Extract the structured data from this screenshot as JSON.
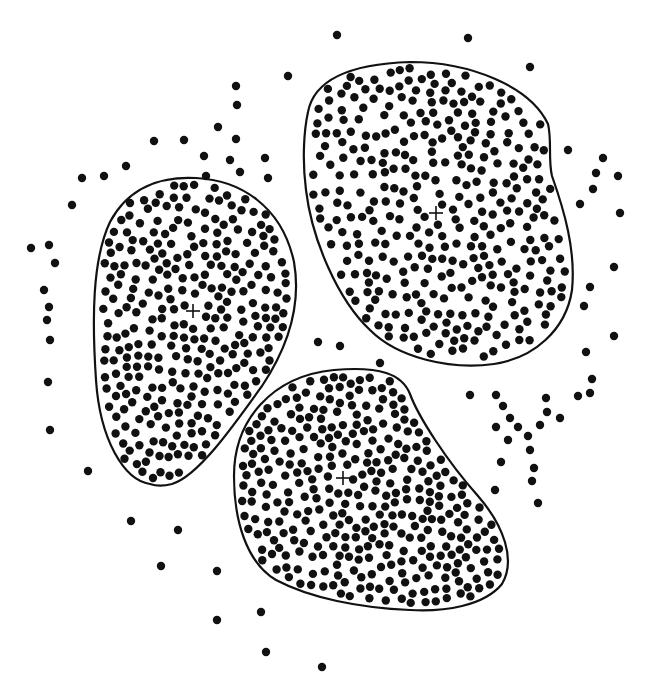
{
  "diagram": {
    "type": "cluster-scatter",
    "width": 662,
    "height": 685,
    "colors": {
      "background": "#ffffff",
      "ink": "#111111"
    },
    "point_radius": 4.2,
    "clusters": [
      {
        "name": "cluster-left",
        "centroid": [
          193,
          311
        ],
        "outline": "M150,484 C124,480 100,440 96,380 C92,320 92,260 110,222 C128,188 160,176 196,178 C240,180 282,206 294,262 C302,308 286,350 262,386 C232,428 198,476 172,484 C164,486 156,486 150,484 Z",
        "point_count": 290,
        "seed": 11
      },
      {
        "name": "cluster-top-right",
        "centroid": [
          436,
          213
        ],
        "outline": "M308,112 C314,80 348,64 410,62 C470,62 530,86 548,124 C552,140 548,160 552,176 C564,210 576,250 572,290 C566,330 534,358 494,364 C450,370 398,358 370,330 C338,300 312,240 306,190 C302,160 304,130 308,112 Z",
        "point_count": 340,
        "seed": 23
      },
      {
        "name": "cluster-bottom",
        "centroid": [
          343,
          478
        ],
        "outline": "M234,476 C234,420 272,376 334,370 C380,366 402,374 410,394 C418,416 446,460 478,496 C504,526 516,560 502,584 C484,606 444,612 410,610 C360,608 310,598 276,580 C246,562 234,520 234,476 Z",
        "point_count": 330,
        "seed": 37
      }
    ],
    "outliers": [
      [
        337,
        35
      ],
      [
        468,
        38
      ],
      [
        530,
        67
      ],
      [
        288,
        76
      ],
      [
        236,
        86
      ],
      [
        237,
        105
      ],
      [
        218,
        127
      ],
      [
        236,
        139
      ],
      [
        154,
        141
      ],
      [
        184,
        140
      ],
      [
        230,
        160
      ],
      [
        204,
        156
      ],
      [
        240,
        172
      ],
      [
        265,
        158
      ],
      [
        268,
        178
      ],
      [
        206,
        176
      ],
      [
        126,
        166
      ],
      [
        104,
        176
      ],
      [
        82,
        178
      ],
      [
        72,
        205
      ],
      [
        31,
        248
      ],
      [
        49,
        245
      ],
      [
        55,
        263
      ],
      [
        44,
        290
      ],
      [
        49,
        307
      ],
      [
        47,
        320
      ],
      [
        50,
        340
      ],
      [
        48,
        382
      ],
      [
        50,
        430
      ],
      [
        88,
        471
      ],
      [
        131,
        521
      ],
      [
        178,
        530
      ],
      [
        161,
        566
      ],
      [
        217,
        571
      ],
      [
        217,
        620
      ],
      [
        261,
        612
      ],
      [
        266,
        652
      ],
      [
        322,
        667
      ],
      [
        568,
        150
      ],
      [
        603,
        158
      ],
      [
        596,
        173
      ],
      [
        618,
        176
      ],
      [
        593,
        189
      ],
      [
        580,
        204
      ],
      [
        620,
        213
      ],
      [
        614,
        267
      ],
      [
        590,
        287
      ],
      [
        584,
        306
      ],
      [
        586,
        352
      ],
      [
        614,
        336
      ],
      [
        578,
        396
      ],
      [
        590,
        393
      ],
      [
        508,
        440
      ],
      [
        470,
        395
      ],
      [
        496,
        395
      ],
      [
        503,
        406
      ],
      [
        510,
        418
      ],
      [
        496,
        427
      ],
      [
        518,
        427
      ],
      [
        540,
        425
      ],
      [
        560,
        418
      ],
      [
        546,
        398
      ],
      [
        547,
        412
      ],
      [
        528,
        436
      ],
      [
        530,
        450
      ],
      [
        534,
        468
      ],
      [
        532,
        481
      ],
      [
        501,
        462
      ],
      [
        495,
        490
      ],
      [
        538,
        503
      ],
      [
        592,
        379
      ],
      [
        318,
        342
      ],
      [
        340,
        346
      ],
      [
        380,
        363
      ]
    ]
  }
}
